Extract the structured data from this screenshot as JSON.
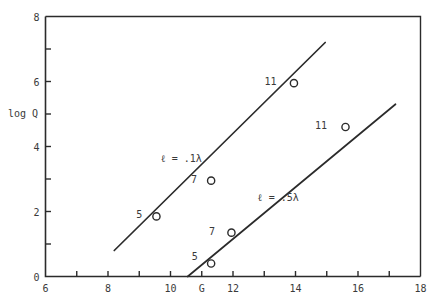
{
  "chart_data": {
    "type": "line",
    "title": "",
    "xlabel": "",
    "ylabel": "log Q",
    "xlim": [
      6,
      18
    ],
    "ylim": [
      0,
      8
    ],
    "grid": false,
    "legend": "inline-annotations",
    "x_ticks": [
      {
        "value": 6,
        "label": "6"
      },
      {
        "value": 7,
        "label": ""
      },
      {
        "value": 8,
        "label": "8"
      },
      {
        "value": 9,
        "label": ""
      },
      {
        "value": 10,
        "label": "10"
      },
      {
        "value": 11,
        "label": "G"
      },
      {
        "value": 12,
        "label": "12"
      },
      {
        "value": 13,
        "label": ""
      },
      {
        "value": 14,
        "label": "14"
      },
      {
        "value": 15,
        "label": ""
      },
      {
        "value": 16,
        "label": "16"
      },
      {
        "value": 17,
        "label": ""
      },
      {
        "value": 18,
        "label": "18"
      }
    ],
    "y_ticks": [
      {
        "value": 0,
        "label": "0"
      },
      {
        "value": 1,
        "label": ""
      },
      {
        "value": 2,
        "label": "2"
      },
      {
        "value": 3,
        "label": ""
      },
      {
        "value": 4,
        "label": "4"
      },
      {
        "value": 5,
        "label": ""
      },
      {
        "value": 6,
        "label": "6"
      },
      {
        "value": 7,
        "label": ""
      },
      {
        "value": 8,
        "label": "8"
      }
    ],
    "series": [
      {
        "name": "l = .1λ",
        "annotation": "ℓ  =  .1λ",
        "annotation_x": 10.35,
        "annotation_y": 3.65,
        "line_start": {
          "x": 8.2,
          "y": 0.8
        },
        "line_end": {
          "x": 14.95,
          "y": 7.2
        },
        "points": [
          {
            "x": 9.55,
            "y": 1.85,
            "label": "5",
            "label_dx": -0.55,
            "label_dy": 0.06
          },
          {
            "x": 11.3,
            "y": 2.95,
            "label": "7",
            "label_dx": -0.55,
            "label_dy": 0.06
          },
          {
            "x": 13.95,
            "y": 5.95,
            "label": "11",
            "label_dx": -0.75,
            "label_dy": 0.06
          }
        ]
      },
      {
        "name": "l = .5λ",
        "annotation": "ℓ  =  .5λ",
        "annotation_x": 13.45,
        "annotation_y": 2.45,
        "line_start": {
          "x": 10.55,
          "y": 0.0
        },
        "line_end": {
          "x": 17.2,
          "y": 5.3
        },
        "points": [
          {
            "x": 11.3,
            "y": 0.4,
            "label": "5",
            "label_dx": -0.52,
            "label_dy": 0.22
          },
          {
            "x": 11.95,
            "y": 1.35,
            "label": "7",
            "label_dx": -0.62,
            "label_dy": 0.06
          },
          {
            "x": 15.6,
            "y": 4.6,
            "label": "11",
            "label_dx": -0.78,
            "label_dy": 0.06
          }
        ]
      }
    ],
    "colors": {
      "axis": "#2b2b2b",
      "line": "#2b2b2b",
      "marker_fill": "#ffffff",
      "marker_stroke": "#2b2b2b",
      "text": "#3a3a3a",
      "background": "#ffffff"
    }
  }
}
